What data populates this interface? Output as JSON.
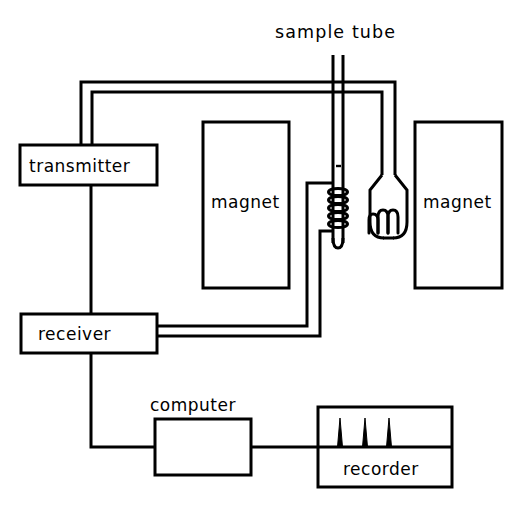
{
  "diagram": {
    "background_color": "#ffffff",
    "line_color": "#000000",
    "labels": {
      "sample_tube": "sample tube",
      "transmitter": "transmitter",
      "receiver": "receiver",
      "magnet_left": "magnet",
      "magnet_right": "magnet",
      "computer": "computer",
      "recorder": "recorder"
    },
    "components": [
      {
        "name": "sample-tube",
        "label": "sample tube",
        "type": "tube",
        "label_position": "top"
      },
      {
        "name": "transmitter",
        "label": "transmitter",
        "type": "box",
        "label_position": "inside"
      },
      {
        "name": "receiver",
        "label": "receiver",
        "type": "box",
        "label_position": "inside"
      },
      {
        "name": "magnet-left",
        "label": "magnet",
        "type": "box",
        "label_position": "inside"
      },
      {
        "name": "magnet-right",
        "label": "magnet",
        "type": "box",
        "label_position": "inside"
      },
      {
        "name": "computer",
        "label": "computer",
        "type": "box",
        "label_position": "above"
      },
      {
        "name": "recorder",
        "label": "recorder",
        "type": "box",
        "label_position": "inside-bottom"
      },
      {
        "name": "rf-coil",
        "label": "",
        "type": "coil",
        "turns": 5
      },
      {
        "name": "dewar-flask",
        "label": "",
        "type": "flask",
        "turns": 3
      }
    ],
    "connections": [
      {
        "from": "transmitter",
        "to": "dewar-flask",
        "wires": 2
      },
      {
        "from": "rf-coil",
        "to": "receiver",
        "wires": 2
      },
      {
        "from": "transmitter",
        "to": "receiver",
        "wires": 1
      },
      {
        "from": "receiver",
        "to": "computer",
        "wires": 1
      },
      {
        "from": "computer",
        "to": "recorder",
        "wires": 1
      }
    ],
    "recorder_trace": {
      "peaks": 3,
      "baseline_y": 447,
      "peak_positions": [
        340,
        365,
        389
      ],
      "peak_height": 29
    }
  }
}
